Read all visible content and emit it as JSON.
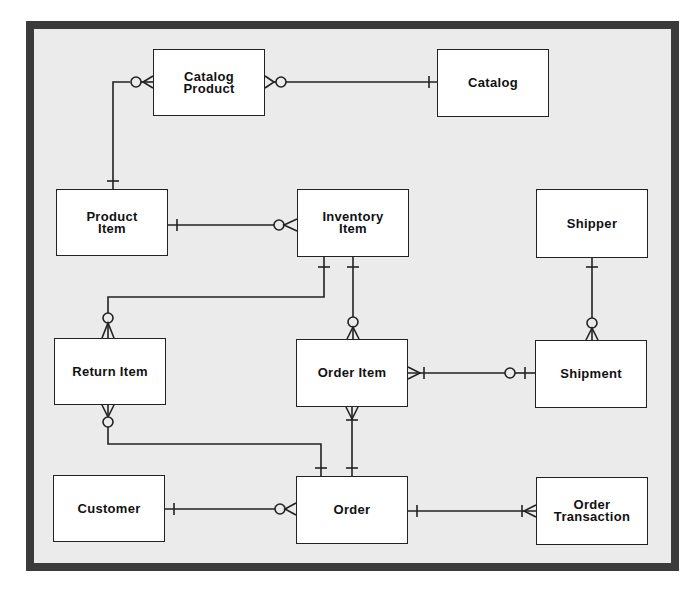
{
  "diagram": {
    "type": "entity-relationship",
    "notation": "crow's foot",
    "frame_color": "#3b3b3b",
    "background_color": "#ebebeb",
    "entities": [
      {
        "id": "catalog_product",
        "label": "Catalog\nProduct"
      },
      {
        "id": "catalog",
        "label": "Catalog"
      },
      {
        "id": "product_item",
        "label": "Product\nItem"
      },
      {
        "id": "inventory_item",
        "label": "Inventory\nItem"
      },
      {
        "id": "shipper",
        "label": "Shipper"
      },
      {
        "id": "return_item",
        "label": "Return Item"
      },
      {
        "id": "order_item",
        "label": "Order Item"
      },
      {
        "id": "shipment",
        "label": "Shipment"
      },
      {
        "id": "customer",
        "label": "Customer"
      },
      {
        "id": "order",
        "label": "Order"
      },
      {
        "id": "order_transaction",
        "label": "Order\nTransaction"
      }
    ],
    "relationships": [
      {
        "from": "Catalog",
        "to": "Catalog Product",
        "from_card": "one",
        "to_card": "zero-or-many"
      },
      {
        "from": "Product Item",
        "to": "Catalog Product",
        "from_card": "one",
        "to_card": "zero-or-many"
      },
      {
        "from": "Product Item",
        "to": "Inventory Item",
        "from_card": "one",
        "to_card": "zero-or-many"
      },
      {
        "from": "Inventory Item",
        "to": "Return Item",
        "from_card": "one",
        "to_card": "zero-or-many"
      },
      {
        "from": "Inventory Item",
        "to": "Order Item",
        "from_card": "one",
        "to_card": "zero-or-many"
      },
      {
        "from": "Shipper",
        "to": "Shipment",
        "from_card": "one",
        "to_card": "zero-or-many"
      },
      {
        "from": "Shipment",
        "to": "Order Item",
        "from_card": "zero-or-one",
        "to_card": "one-or-many"
      },
      {
        "from": "Order",
        "to": "Return Item",
        "from_card": "one",
        "to_card": "zero-or-many"
      },
      {
        "from": "Order",
        "to": "Order Item",
        "from_card": "one",
        "to_card": "one-or-many"
      },
      {
        "from": "Customer",
        "to": "Order",
        "from_card": "one",
        "to_card": "zero-or-many"
      },
      {
        "from": "Order",
        "to": "Order Transaction",
        "from_card": "one",
        "to_card": "one-or-many"
      }
    ]
  }
}
